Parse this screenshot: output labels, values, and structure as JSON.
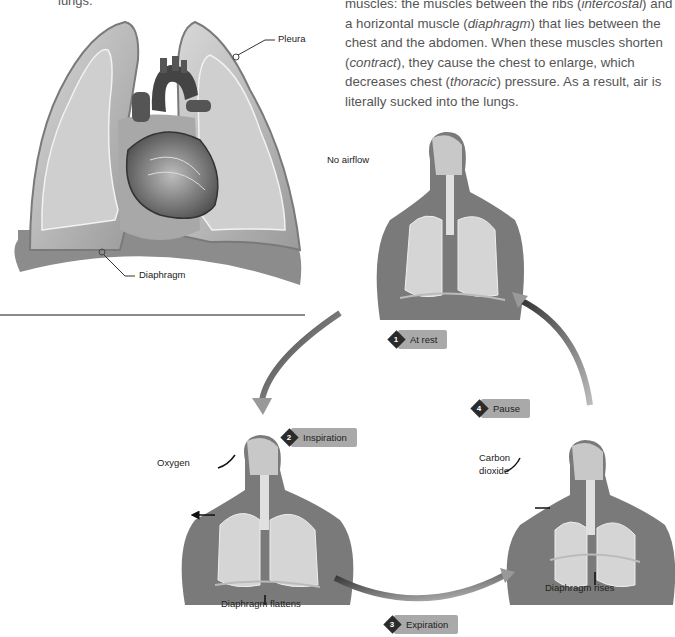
{
  "top_fragment": "lungs.",
  "paragraph": {
    "line1_pre": "muscles: the muscles between the ribs (",
    "line1_em": "intercostal",
    "line1_post": ") and",
    "line2_pre": "a horizontal muscle (",
    "line2_em": "diaphragm",
    "line2_post": ") that lies between the",
    "line3": "chest and the abdomen. When these muscles shorten",
    "line4_pre": "(",
    "line4_em": "contract",
    "line4_post": "), they cause the chest to enlarge, which",
    "line5_pre": "decreases chest (",
    "line5_em": "thoracic",
    "line5_post": ") pressure. As a result, air is",
    "line6": "literally sucked into the lungs."
  },
  "anatomy_figure": {
    "labels": {
      "pleura": "Pleura",
      "diaphragm": "Diaphragm"
    }
  },
  "cycle": {
    "steps": [
      {
        "number": "1",
        "label": "At rest"
      },
      {
        "number": "2",
        "label": "Inspiration"
      },
      {
        "number": "3",
        "label": "Expiration"
      },
      {
        "number": "4",
        "label": "Pause"
      }
    ],
    "callouts": {
      "no_airflow": "No airflow",
      "oxygen": "Oxygen",
      "diaphragm_flattens": "Diaphragm flattens",
      "carbon": "Carbon",
      "dioxide": "dioxide",
      "diaphragm_rises": "Diaphragm rises"
    }
  },
  "colors": {
    "step_badge": "#a9a9a9",
    "step_diamond": "#2b2b2b",
    "divider": "#8a8a8a"
  }
}
